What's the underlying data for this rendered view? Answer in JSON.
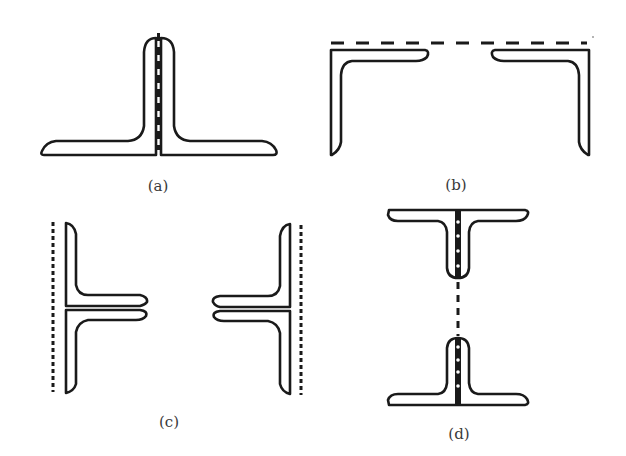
{
  "figure": {
    "panels": [
      {
        "id": "a",
        "label": "(a)",
        "description": "Two angles placed back to back forming an inverted T, riveted through the vertical legs"
      },
      {
        "id": "b",
        "label": "(b)",
        "description": "Two angles placed with horizontal legs in line, opening downward, joined along a dashed line on top"
      },
      {
        "id": "c",
        "label": "(c)",
        "description": "Two pairs of back-to-back angles with horizontal legs facing each other, dotted lines on outer faces"
      },
      {
        "id": "d",
        "label": "(d)",
        "description": "Two T-sections formed from back-to-back angles, connected by a dashed line between stems"
      }
    ]
  }
}
